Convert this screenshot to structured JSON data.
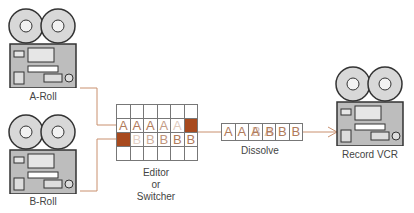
{
  "devices": {
    "a_roll": {
      "label": "A-Roll"
    },
    "b_roll": {
      "label": "B-Roll"
    },
    "record": {
      "label": "Record VCR"
    }
  },
  "editor": {
    "label_line1": "Editor",
    "label_line2": "or",
    "label_line3": "Switcher",
    "grid": {
      "rows": [
        [
          "",
          "",
          "",
          "",
          "",
          ""
        ],
        [
          "A",
          "A",
          "A",
          "A",
          "A",
          "#"
        ],
        [
          "#",
          "B",
          "B",
          "B",
          "B",
          "B"
        ],
        [
          "",
          "",
          "",
          "",
          "",
          ""
        ]
      ]
    }
  },
  "output_strip": {
    "cells": [
      "A",
      "A",
      "A/B",
      "A/B",
      "B",
      "B"
    ],
    "label": "Dissolve"
  },
  "colors": {
    "line": "#c9906f",
    "fill": "#a84a1e",
    "letter": "#b07a5a"
  }
}
